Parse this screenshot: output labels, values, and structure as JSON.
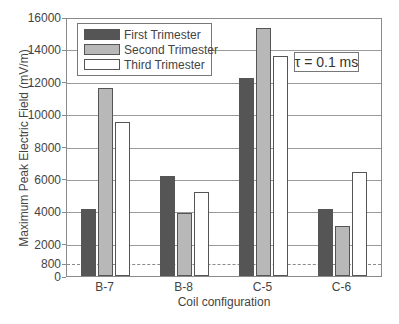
{
  "chart_data": {
    "type": "bar",
    "title": "",
    "xlabel": "Coil configuration",
    "ylabel": "Maximum Peak Electric Field (mV/m)",
    "ylim": [
      0,
      16000
    ],
    "yticks": [
      0,
      800,
      2000,
      4000,
      6000,
      8000,
      10000,
      12000,
      14000,
      16000
    ],
    "ytick_labels": [
      "0",
      "800",
      "2000",
      "4000",
      "6000",
      "8000",
      "10000",
      "12000",
      "14000",
      "16000"
    ],
    "gridlines": [
      2000,
      4000,
      6000,
      8000,
      10000,
      12000,
      14000
    ],
    "reference_line": {
      "value": 800,
      "style": "dashed"
    },
    "categories": [
      "B-7",
      "B-8",
      "C-5",
      "C-6"
    ],
    "series": [
      {
        "name": "First Trimester",
        "color": "#555555",
        "values": [
          4150,
          6200,
          12250,
          4150
        ]
      },
      {
        "name": "Second Trimester",
        "color": "#b8b8b8",
        "values": [
          11600,
          3900,
          15300,
          3100
        ]
      },
      {
        "name": "Third Trimester",
        "color": "#ffffff",
        "values": [
          9500,
          5200,
          13600,
          6400
        ]
      }
    ],
    "legend_position": "upper left",
    "annotation": "τ = 0.1 ms",
    "grid": true
  },
  "legend": {
    "items": [
      {
        "label": "First Trimester",
        "color": "#555555"
      },
      {
        "label": "Second Trimester",
        "color": "#b8b8b8"
      },
      {
        "label": "Third Trimester",
        "color": "#ffffff"
      }
    ]
  },
  "annotation": {
    "text": "τ = 0.1 ms"
  },
  "axes": {
    "xlabel": "Coil configuration",
    "ylabel": "Maximum Peak Electric Field (mV/m)"
  }
}
